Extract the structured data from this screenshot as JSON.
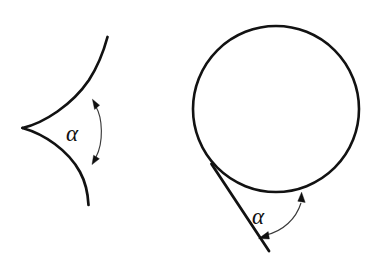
{
  "figure": {
    "background_color": "#ffffff",
    "stroke_color": "#121212",
    "arrow_color": "#3a3a3a",
    "label_color": "#111111",
    "panels": [
      {
        "name": "cusp-triangle-panel",
        "shape": "curvilinear-cusp-triangle",
        "angle_label": "α",
        "angle_symbol_name": "alpha",
        "cusp_point": [
          22,
          128
        ],
        "upper_arc_end": [
          107,
          38
        ],
        "lower_arc_end": [
          88,
          205
        ],
        "label_position": [
          66,
          141
        ],
        "arrow_arc_start": [
          95,
          102
        ],
        "arrow_arc_end": [
          95,
          160
        ]
      },
      {
        "name": "circle-tangent-panel",
        "shape": "circle-with-tangent-line",
        "angle_label": "α",
        "angle_symbol_name": "alpha",
        "circle_center": [
          276,
          109
        ],
        "circle_radius": 83,
        "tangent_point": [
          212,
          165
        ],
        "tangent_line_end": [
          269,
          251
        ],
        "label_position": [
          252,
          224
        ],
        "arrow_arc_start": [
          263,
          237
        ],
        "arrow_arc_end": [
          300,
          196
        ]
      }
    ]
  }
}
